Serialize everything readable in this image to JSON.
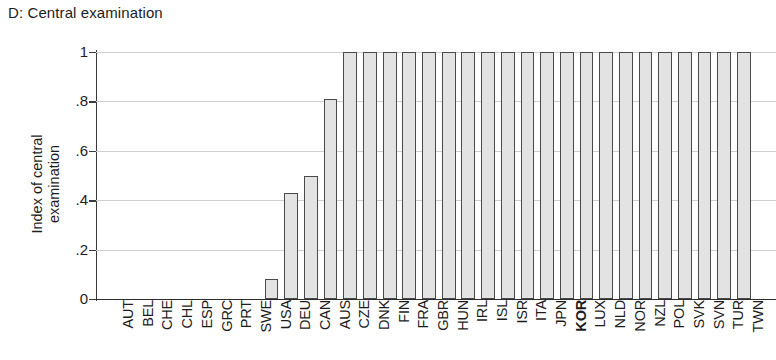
{
  "panel": {
    "title": "D: Central examination"
  },
  "axes": {
    "y_title": "Index of central\nexamination",
    "y_ticks": [
      "0",
      ".2",
      ".4",
      ".6",
      ".8",
      "1"
    ],
    "x_title": ""
  },
  "style": {
    "bar_fill": "#e3e3e3",
    "bar_border": "#4a4a4a",
    "grid_color": "#cfcfcf",
    "axis_color": "#2d2d2d",
    "text_color": "#1d1d1d"
  },
  "highlight": {
    "category": "KOR",
    "bold": true
  },
  "chart_data": {
    "type": "bar",
    "title": "D: Central examination",
    "xlabel": "",
    "ylabel": "Index of central examination",
    "ylim": [
      0,
      1
    ],
    "yticks": [
      0,
      0.2,
      0.4,
      0.6,
      0.8,
      1
    ],
    "grid": true,
    "legend": null,
    "orientation": "vertical",
    "highlighted_category": "KOR",
    "categories": [
      "AUT",
      "BEL",
      "CHE",
      "CHL",
      "ESP",
      "GRC",
      "PRT",
      "SWE",
      "USA",
      "DEU",
      "CAN",
      "AUS",
      "CZE",
      "DNK",
      "FIN",
      "FRA",
      "GBR",
      "HUN",
      "IRL",
      "ISL",
      "ISR",
      "ITA",
      "JPN",
      "KOR",
      "LUX",
      "NLD",
      "NOR",
      "NZL",
      "POL",
      "SVK",
      "SVN",
      "TUR",
      "TWN"
    ],
    "values": [
      0,
      0,
      0,
      0,
      0,
      0,
      0,
      0,
      0.08,
      0.43,
      0.5,
      0.81,
      1,
      1,
      1,
      1,
      1,
      1,
      1,
      1,
      1,
      1,
      1,
      1,
      1,
      1,
      1,
      1,
      1,
      1,
      1,
      1,
      1
    ]
  }
}
